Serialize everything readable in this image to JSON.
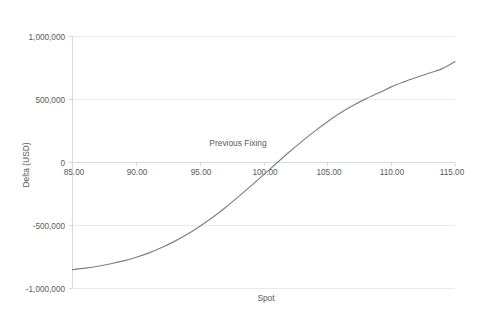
{
  "chart_data": {
    "type": "line",
    "title": "",
    "xlabel": "Spot",
    "ylabel": "Delta (USD)",
    "xlim": [
      85,
      115
    ],
    "ylim": [
      -1000000,
      1000000
    ],
    "grid": true,
    "legend": "none",
    "x_ticks": [
      85,
      90,
      95,
      100,
      105,
      110,
      115
    ],
    "x_tick_labels": [
      "85.00",
      "90.00",
      "95.00",
      "100.00",
      "105.00",
      "110.00",
      "115.00"
    ],
    "y_ticks": [
      -1000000,
      -500000,
      0,
      500000,
      1000000
    ],
    "y_tick_labels": [
      "-1,000,000",
      "-500,000",
      "0",
      "500,000",
      "1,000,000"
    ],
    "series": [
      {
        "name": "Delta",
        "color": "#7f7f7f",
        "x": [
          85,
          86,
          87,
          88,
          89,
          90,
          91,
          92,
          93,
          94,
          95,
          96,
          97,
          98,
          99,
          100,
          101,
          102,
          103,
          104,
          105,
          106,
          107,
          108,
          109,
          110,
          111,
          112,
          113,
          114,
          115
        ],
        "values": [
          -850000,
          -838000,
          -823000,
          -804000,
          -781000,
          -752000,
          -717000,
          -675000,
          -626000,
          -570000,
          -506000,
          -435000,
          -357000,
          -273000,
          -186000,
          -96000,
          -6000,
          83000,
          168000,
          249000,
          324000,
          392000,
          452000,
          505000,
          551000,
          600000,
          640000,
          676000,
          710000,
          745000,
          800000
        ]
      }
    ],
    "annotations": [
      {
        "text": "Previous Fixing",
        "x": 96.9,
        "y": 250000
      }
    ]
  },
  "footer": {
    "caption": ""
  }
}
